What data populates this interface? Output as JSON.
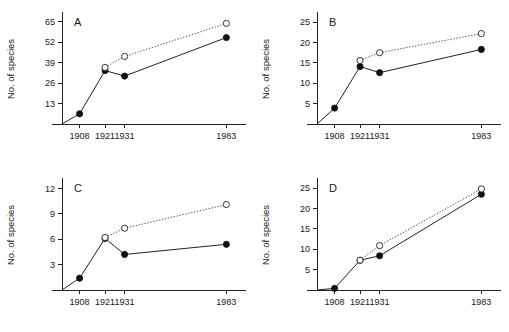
{
  "figure": {
    "title": "",
    "axis_title_y": "No. of species",
    "x_categories": [
      "1908",
      "1921",
      "1931",
      "1983"
    ],
    "x_values": [
      1908,
      1921,
      1931,
      1983
    ],
    "panels": [
      "A",
      "B",
      "C",
      "D"
    ]
  },
  "chart_data": [
    {
      "type": "line",
      "panel": "A",
      "title": "A",
      "xlabel": "",
      "ylabel": "No. of species",
      "x": [
        1908,
        1921,
        1931,
        1983
      ],
      "xticklabels": [
        "1908",
        "1921",
        "1931",
        "1983"
      ],
      "yticks": [
        13,
        26,
        39,
        52,
        65
      ],
      "yticklabels": [
        "13",
        "26",
        "39",
        "52",
        "65"
      ],
      "ylim": [
        0,
        70
      ],
      "xlim": [
        1899,
        1991
      ],
      "grid": false,
      "legend": "none",
      "series": [
        {
          "name": "observed",
          "marker": "filled-circle",
          "linestyle": "solid",
          "x": [
            1908,
            1921,
            1931,
            1983
          ],
          "values": [
            6.5,
            34,
            30.5,
            55
          ]
        },
        {
          "name": "estimated",
          "marker": "open-circle",
          "linestyle": "dotted",
          "x": [
            1921,
            1931,
            1983
          ],
          "values": [
            36,
            43,
            64
          ]
        }
      ]
    },
    {
      "type": "line",
      "panel": "B",
      "title": "B",
      "xlabel": "",
      "ylabel": "No. of species",
      "x": [
        1908,
        1921,
        1931,
        1983
      ],
      "xticklabels": [
        "1908",
        "1921",
        "1931",
        "1983"
      ],
      "yticks": [
        5,
        10,
        15,
        20,
        25
      ],
      "yticklabels": [
        "5",
        "10",
        "15",
        "20",
        "25"
      ],
      "ylim": [
        0,
        27
      ],
      "xlim": [
        1899,
        1991
      ],
      "grid": false,
      "legend": "none",
      "series": [
        {
          "name": "observed",
          "marker": "filled-circle",
          "linestyle": "solid",
          "x": [
            1908,
            1921,
            1931,
            1983
          ],
          "values": [
            3.9,
            14.1,
            12.6,
            18.3
          ]
        },
        {
          "name": "estimated",
          "marker": "open-circle",
          "linestyle": "dotted",
          "x": [
            1921,
            1931,
            1983
          ],
          "values": [
            15.6,
            17.5,
            22.2
          ]
        }
      ]
    },
    {
      "type": "line",
      "panel": "C",
      "title": "C",
      "xlabel": "",
      "ylabel": "No. of species",
      "x": [
        1908,
        1921,
        1931,
        1983
      ],
      "xticklabels": [
        "1908",
        "1921",
        "1931",
        "1983"
      ],
      "yticks": [
        3,
        6,
        9,
        12
      ],
      "yticklabels": [
        "3",
        "6",
        "9",
        "12"
      ],
      "ylim": [
        0,
        13
      ],
      "xlim": [
        1899,
        1991
      ],
      "grid": false,
      "legend": "none",
      "series": [
        {
          "name": "observed",
          "marker": "filled-circle",
          "linestyle": "solid",
          "x": [
            1908,
            1921,
            1931,
            1983
          ],
          "values": [
            1.4,
            6.1,
            4.2,
            5.4
          ]
        },
        {
          "name": "estimated",
          "marker": "open-circle",
          "linestyle": "dotted",
          "x": [
            1921,
            1931,
            1983
          ],
          "values": [
            6.2,
            7.3,
            10.1
          ]
        }
      ]
    },
    {
      "type": "line",
      "panel": "D",
      "title": "D",
      "xlabel": "",
      "ylabel": "No. of species",
      "x": [
        1908,
        1921,
        1931,
        1983
      ],
      "xticklabels": [
        "1908",
        "1921",
        "1931",
        "1983"
      ],
      "yticks": [
        5,
        10,
        15,
        20,
        25
      ],
      "yticklabels": [
        "5",
        "10",
        "15",
        "20",
        "25"
      ],
      "ylim": [
        0,
        27
      ],
      "xlim": [
        1899,
        1991
      ],
      "grid": false,
      "legend": "none",
      "series": [
        {
          "name": "observed",
          "marker": "filled-circle",
          "linestyle": "solid",
          "x": [
            1908,
            1921,
            1931,
            1983
          ],
          "values": [
            0.4,
            7.3,
            8.4,
            23.5
          ]
        },
        {
          "name": "estimated",
          "marker": "open-circle",
          "linestyle": "dotted",
          "x": [
            1921,
            1931,
            1983
          ],
          "values": [
            7.3,
            10.9,
            24.8
          ]
        }
      ]
    }
  ],
  "colors": {
    "background": "#ffffff",
    "axis": "#222222",
    "solid_series": "#111111",
    "dotted_series": "#555555",
    "text": "#1a1a1a"
  }
}
